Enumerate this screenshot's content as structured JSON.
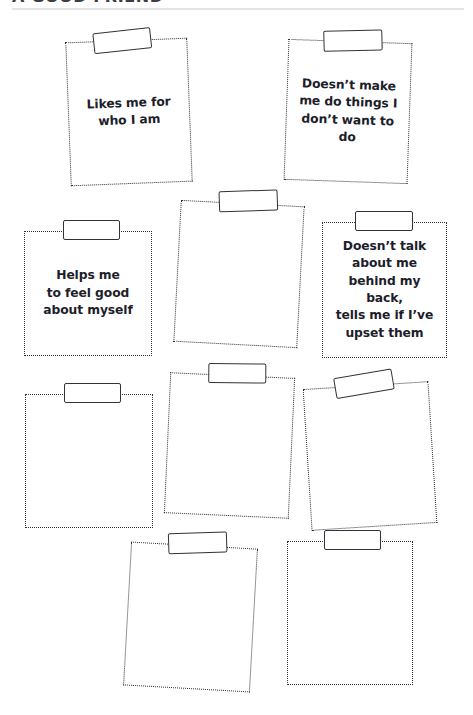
{
  "header": {
    "title": "A GOOD FRIEND",
    "rule_color": "#e4e4e8"
  },
  "theme": {
    "page_background": "#ffffff",
    "card_border_color": "#2e2e38",
    "tape_border_color": "#32323c",
    "text_color": "#1d1d2b"
  },
  "cards": [
    {
      "id": "card-1",
      "text": "Likes me for\nwho I am",
      "filled": true,
      "rotation": -2.2,
      "border_style": "dotted"
    },
    {
      "id": "card-2",
      "text": "Doesn’t make\nme do things I\ndon’t want to do",
      "filled": true,
      "rotation": 2.0,
      "border_style": "dotted"
    },
    {
      "id": "card-3",
      "text": "Helps me\nto feel good\nabout myself",
      "filled": true,
      "rotation": 0,
      "border_style": "dotted"
    },
    {
      "id": "card-4",
      "text": "",
      "filled": false,
      "rotation": 3.0,
      "border_style": "dotted"
    },
    {
      "id": "card-5",
      "text": "Doesn’t talk\nabout me\nbehind my back,\ntells me if I’ve\nupset them",
      "filled": true,
      "rotation": 0,
      "border_style": "dotted"
    },
    {
      "id": "card-6",
      "text": "",
      "filled": false,
      "rotation": 0,
      "border_style": "dotted"
    },
    {
      "id": "card-7",
      "text": "",
      "filled": false,
      "rotation": 2.6,
      "border_style": "dotted"
    },
    {
      "id": "card-8",
      "text": "",
      "filled": false,
      "rotation": -3.6,
      "border_style": "dotted"
    },
    {
      "id": "card-9",
      "text": "",
      "filled": false,
      "rotation": 3.2,
      "border_style": "dotted"
    },
    {
      "id": "card-10",
      "text": "",
      "filled": false,
      "rotation": 0,
      "border_style": "dotted"
    }
  ]
}
